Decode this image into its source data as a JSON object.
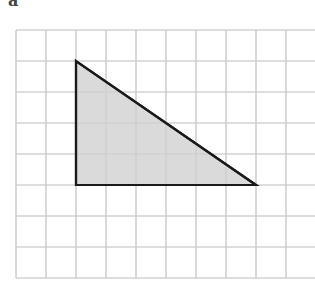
{
  "figure": {
    "label": "a",
    "grid": {
      "origin": [
        16,
        30
      ],
      "cols": 10,
      "rows": 8,
      "cell_w": 30,
      "cell_h": 31,
      "line_color": "#c8c8c8"
    },
    "shape": {
      "type": "right-triangle",
      "vertices_grid": [
        [
          2,
          1
        ],
        [
          2,
          5
        ],
        [
          8,
          5
        ]
      ],
      "fill": "#d3d3d3",
      "stroke": "#1a1a1a",
      "stroke_width": 2.2,
      "legs": {
        "vertical": 4,
        "horizontal": 6
      }
    }
  }
}
